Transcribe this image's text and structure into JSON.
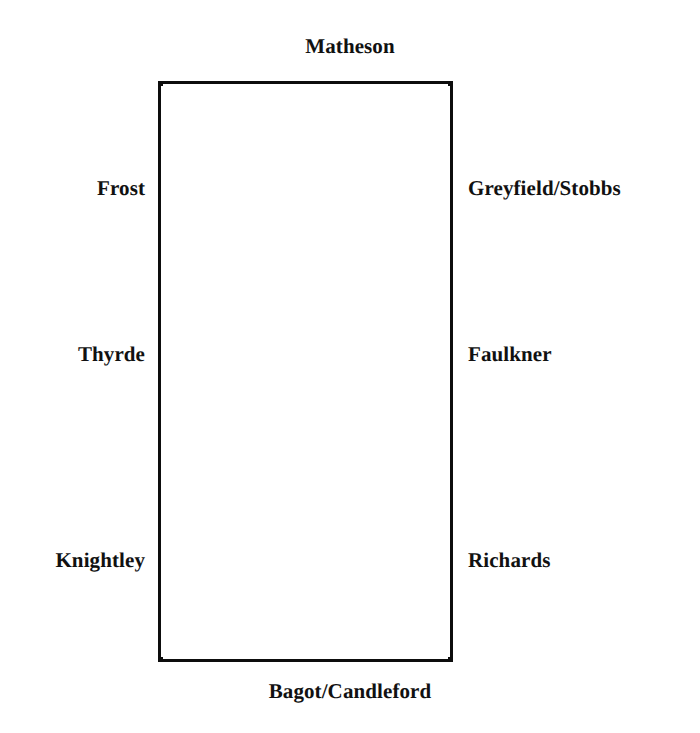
{
  "diagram": {
    "type": "parcel-boundary-plan",
    "shape": "rectangle",
    "background_color": "#ffffff",
    "line_color": "#0d0d0d",
    "text_color": "#111111",
    "rect": {
      "left": 158,
      "top": 81,
      "width": 295,
      "height": 581,
      "border_width": 3
    },
    "boundaries": {
      "top": {
        "label": "Matheson",
        "count": 1
      },
      "bottom": {
        "label": "Bagot/Candleford",
        "count": 1
      },
      "left": [
        {
          "label": "Frost"
        },
        {
          "label": "Thyrde"
        },
        {
          "label": "Knightley"
        }
      ],
      "right": [
        {
          "label": "Greyfield/Stobbs"
        },
        {
          "label": "Faulkner"
        },
        {
          "label": "Richards"
        }
      ]
    }
  }
}
